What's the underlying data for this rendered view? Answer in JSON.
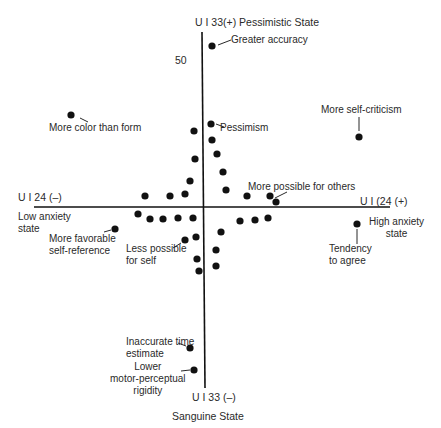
{
  "chart_data": {
    "type": "scatter",
    "title": "",
    "axes": {
      "vertical_top_label": "U I 33(+) Pessimistic State",
      "vertical_bottom_label": "U I 33 (–)",
      "vertical_bottom_sublabel": "Sanguine State",
      "horizontal_left_label": "U I 24 (–)",
      "horizontal_left_sublabel": "Low anxiety\nstate",
      "horizontal_right_label": "U I (24 (+)",
      "horizontal_right_sublabel": "High anxiety\nstate",
      "scale_tick_label": "50",
      "x_axis_pixel": {
        "x1": 34,
        "x2": 390,
        "y": 207
      },
      "y_axis_pixel": {
        "x": 203,
        "y1": 32,
        "y2": 388
      }
    },
    "grid": false,
    "legend": null,
    "points_pixel": [
      {
        "x": 212,
        "y": 46,
        "label": "Greater accuracy"
      },
      {
        "x": 71,
        "y": 115,
        "label": "More color than form"
      },
      {
        "x": 359,
        "y": 137,
        "label": "More self-criticism"
      },
      {
        "x": 211,
        "y": 124,
        "label": "Pessimism"
      },
      {
        "x": 212,
        "y": 140
      },
      {
        "x": 217,
        "y": 154
      },
      {
        "x": 223,
        "y": 172
      },
      {
        "x": 226,
        "y": 190
      },
      {
        "x": 194,
        "y": 131
      },
      {
        "x": 195,
        "y": 159
      },
      {
        "x": 190,
        "y": 181
      },
      {
        "x": 145,
        "y": 196
      },
      {
        "x": 170,
        "y": 196
      },
      {
        "x": 185,
        "y": 194
      },
      {
        "x": 247,
        "y": 196
      },
      {
        "x": 270,
        "y": 196,
        "label": "More possible for others"
      },
      {
        "x": 276,
        "y": 202
      },
      {
        "x": 138,
        "y": 214
      },
      {
        "x": 150,
        "y": 219
      },
      {
        "x": 163,
        "y": 219
      },
      {
        "x": 178,
        "y": 218
      },
      {
        "x": 193,
        "y": 218
      },
      {
        "x": 115,
        "y": 229,
        "label": "More favorable\nself-reference"
      },
      {
        "x": 240,
        "y": 221
      },
      {
        "x": 255,
        "y": 220
      },
      {
        "x": 268,
        "y": 218
      },
      {
        "x": 357,
        "y": 224,
        "label": "Tendency\nto agree"
      },
      {
        "x": 221,
        "y": 232
      },
      {
        "x": 196,
        "y": 237
      },
      {
        "x": 185,
        "y": 240,
        "label": "Less possible\nfor self"
      },
      {
        "x": 216,
        "y": 250
      },
      {
        "x": 216,
        "y": 266
      },
      {
        "x": 197,
        "y": 259
      },
      {
        "x": 199,
        "y": 271
      },
      {
        "x": 190,
        "y": 348,
        "label": "Inaccurate time\nestimate"
      },
      {
        "x": 194,
        "y": 370,
        "label": "Lower\nmotor-perceptual\nrigidity"
      }
    ]
  },
  "labels": {
    "top_axis": "U I 33(+) Pessimistic State",
    "scale_50": "50",
    "greater_accuracy": "Greater accuracy",
    "more_color": "More color than form",
    "pessimism": "Pessimism",
    "self_criticism": "More self-criticism",
    "left_axis": "U I 24 (–)",
    "low_anxiety": "Low anxiety\nstate",
    "more_favorable": "More favorable\nself-reference",
    "less_possible": "Less possible\nfor self",
    "more_possible_others": "More possible for others",
    "right_axis": "U I (24 (+)",
    "high_anxiety": "High anxiety\nstate",
    "tendency_agree": "Tendency\nto agree",
    "inaccurate_time": "Inaccurate time\nestimate",
    "lower_motor": "Lower\nmotor-perceptual\nrigidity",
    "bottom_axis": "U I 33 (–)",
    "sanguine": "Sanguine State"
  },
  "colors": {
    "ink": "#111111",
    "text": "#2a2a2a",
    "background": "#ffffff"
  }
}
